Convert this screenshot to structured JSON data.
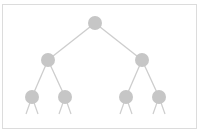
{
  "diagram": {
    "type": "binary-tree",
    "colors": {
      "node": "#c6c6c6",
      "edge": "#cdcdcd",
      "frame": "#dcdcdc"
    },
    "node_radius": 7,
    "nodes": [
      {
        "id": "root",
        "x": 95,
        "y": 23
      },
      {
        "id": "l",
        "x": 48,
        "y": 60
      },
      {
        "id": "r",
        "x": 142,
        "y": 60
      },
      {
        "id": "ll",
        "x": 32,
        "y": 97
      },
      {
        "id": "lr",
        "x": 65,
        "y": 97
      },
      {
        "id": "rl",
        "x": 126,
        "y": 97
      },
      {
        "id": "rr",
        "x": 159,
        "y": 97
      }
    ],
    "edges": [
      [
        "root",
        "l"
      ],
      [
        "root",
        "r"
      ],
      [
        "l",
        "ll"
      ],
      [
        "l",
        "lr"
      ],
      [
        "r",
        "rl"
      ],
      [
        "r",
        "rr"
      ]
    ],
    "stubs": [
      {
        "from": "ll",
        "dx": [
          -6,
          6
        ]
      },
      {
        "from": "lr",
        "dx": [
          -6,
          6
        ]
      },
      {
        "from": "rl",
        "dx": [
          -6,
          6
        ]
      },
      {
        "from": "rr",
        "dx": [
          -6,
          6
        ]
      }
    ]
  }
}
